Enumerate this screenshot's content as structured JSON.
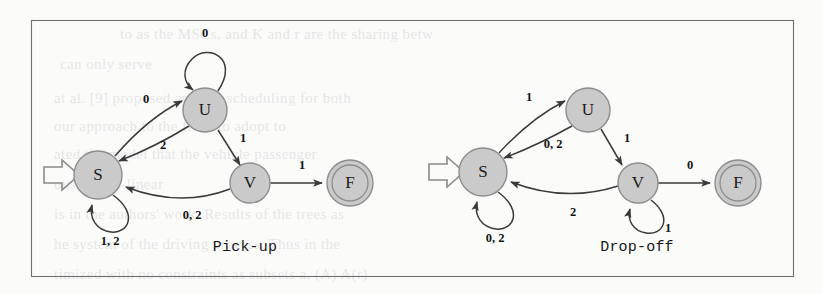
{
  "figure": {
    "background_color": "#fbfbfa",
    "border_color": "#6f6f6f",
    "node_fill": "#cacaca",
    "node_stroke": "#8d8d8d",
    "edge_color": "#3a3a3a",
    "text_color": "#141414",
    "panels": [
      {
        "id": "pick-up",
        "caption": "Pick-up",
        "states": [
          {
            "id": "S",
            "label": "S",
            "x": 98,
            "y": 175,
            "r": 24,
            "accepting": false,
            "start": true
          },
          {
            "id": "U",
            "label": "U",
            "x": 205,
            "y": 110,
            "r": 22,
            "accepting": false,
            "start": false
          },
          {
            "id": "V",
            "label": "V",
            "x": 250,
            "y": 183,
            "r": 20,
            "accepting": false,
            "start": false
          },
          {
            "id": "F",
            "label": "F",
            "x": 350,
            "y": 183,
            "r": 23,
            "accepting": true,
            "start": false
          }
        ],
        "transitions": [
          {
            "from": "S",
            "to": "U",
            "label": "0",
            "kind": "curve-up",
            "label_x": 146,
            "label_y": 100
          },
          {
            "from": "U",
            "to": "S",
            "label": "2",
            "kind": "curve-down",
            "label_x": 163,
            "label_y": 146
          },
          {
            "from": "U",
            "to": "U",
            "label": "0",
            "kind": "self-top",
            "label_x": 205,
            "label_y": 34
          },
          {
            "from": "U",
            "to": "V",
            "label": "1",
            "kind": "straight",
            "label_x": 243,
            "label_y": 139
          },
          {
            "from": "V",
            "to": "S",
            "label": "0, 2",
            "kind": "curve-long",
            "label_x": 192,
            "label_y": 216
          },
          {
            "from": "V",
            "to": "F",
            "label": "1",
            "kind": "straight",
            "label_x": 302,
            "label_y": 166
          },
          {
            "from": "S",
            "to": "S",
            "label": "1, 2",
            "kind": "self-bottom",
            "label_x": 110,
            "label_y": 242
          }
        ]
      },
      {
        "id": "drop-off",
        "caption": "Drop-off",
        "states": [
          {
            "id": "S",
            "label": "S",
            "x": 483,
            "y": 172,
            "r": 24,
            "accepting": false,
            "start": true
          },
          {
            "id": "U",
            "label": "U",
            "x": 588,
            "y": 110,
            "r": 22,
            "accepting": false,
            "start": false
          },
          {
            "id": "V",
            "label": "V",
            "x": 638,
            "y": 183,
            "r": 20,
            "accepting": false,
            "start": false
          },
          {
            "id": "F",
            "label": "F",
            "x": 738,
            "y": 183,
            "r": 23,
            "accepting": true,
            "start": false
          }
        ],
        "transitions": [
          {
            "from": "S",
            "to": "U",
            "label": "1",
            "kind": "curve-up",
            "label_x": 529,
            "label_y": 98
          },
          {
            "from": "U",
            "to": "S",
            "label": "0, 2",
            "kind": "curve-down",
            "label_x": 553,
            "label_y": 145
          },
          {
            "from": "U",
            "to": "V",
            "label": "1",
            "kind": "straight",
            "label_x": 627,
            "label_y": 139
          },
          {
            "from": "V",
            "to": "S",
            "label": "2",
            "kind": "curve-long",
            "label_x": 573,
            "label_y": 213
          },
          {
            "from": "V",
            "to": "F",
            "label": "0",
            "kind": "straight",
            "label_x": 690,
            "label_y": 166
          },
          {
            "from": "V",
            "to": "V",
            "label": "1",
            "kind": "self-bottom",
            "label_x": 668,
            "label_y": 229
          },
          {
            "from": "S",
            "to": "S",
            "label": "0, 2",
            "kind": "self-bottom",
            "label_x": 495,
            "label_y": 239
          }
        ]
      }
    ],
    "bleed_text": [
      {
        "text": "to as the MSCs, and K and r are the sharing betw",
        "x": 120,
        "y": 26,
        "size": 15
      },
      {
        "text": "can only serve",
        "x": 60,
        "y": 56,
        "size": 15
      },
      {
        "text": "at al. [9] proposed another scheduling for both",
        "x": 54,
        "y": 90,
        "size": 15
      },
      {
        "text": "our approach to the filter to adopt to",
        "x": 54,
        "y": 118,
        "size": 15
      },
      {
        "text": "ated the model that the vehicle passenger",
        "x": 54,
        "y": 146,
        "size": 15
      },
      {
        "text": "ous or non-linear",
        "x": 54,
        "y": 176,
        "size": 15
      },
      {
        "text": "is in the authors' work. Results of the trees as",
        "x": 54,
        "y": 206,
        "size": 15
      },
      {
        "text": "he system of the driving process. Thus in the",
        "x": 54,
        "y": 236,
        "size": 15
      },
      {
        "text": "timized with no constraints as subsets a, (A) A(r)",
        "x": 54,
        "y": 266,
        "size": 15
      }
    ]
  }
}
